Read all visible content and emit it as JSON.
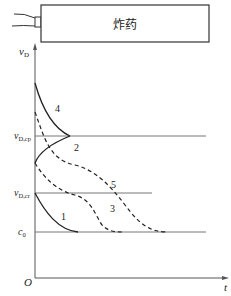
{
  "explosive_box": {
    "label": "炸药"
  },
  "axes": {
    "y_label": "v",
    "y_label_sub": "D",
    "x_label": "t",
    "origin": "O"
  },
  "levels": {
    "cp": {
      "main": "v",
      "sub": "D,cp"
    },
    "cr": {
      "main": "v",
      "sub": "D,cr"
    },
    "c0": {
      "main": "c",
      "sub": "0"
    }
  },
  "curves": [
    {
      "id": "1",
      "label": "1",
      "style": "solid",
      "description": "starts at vD,cr, decays to c0"
    },
    {
      "id": "2",
      "label": "2",
      "style": "solid",
      "description": "rises from below to vD,cp"
    },
    {
      "id": "3",
      "label": "3",
      "style": "dashed",
      "description": "starts between vD,cp and vD,cr, decays to c0"
    },
    {
      "id": "4",
      "label": "4",
      "style": "solid",
      "description": "starts above vD,cp, decays to vD,cp"
    },
    {
      "id": "5",
      "label": "5",
      "style": "dashed",
      "description": "starts above vD,cp, decays through vD,cr to c0"
    }
  ],
  "colors": {
    "line": "#222222",
    "axis": "#555555",
    "level": "#777777"
  }
}
